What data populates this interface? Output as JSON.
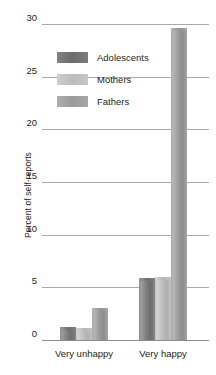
{
  "chart_data": {
    "type": "bar",
    "title": "",
    "subtitle": "",
    "xlabel": "",
    "ylabel": "Percent of self-reports",
    "categories": [
      "Very unhappy",
      "Very happy"
    ],
    "series": [
      {
        "name": "Adolescents",
        "color": "#6c6c6c",
        "values": [
          1.2,
          5.9
        ]
      },
      {
        "name": "Mothers",
        "color": "#bcbcbc",
        "values": [
          1.1,
          6.0
        ]
      },
      {
        "name": "Fathers",
        "color": "#9a9a9a",
        "values": [
          3.0,
          29.6
        ]
      }
    ],
    "ylim": [
      0,
      30
    ],
    "yticks": [
      0,
      5,
      10,
      15,
      20,
      25,
      30
    ],
    "ytick_labels": [
      "0",
      "5",
      "10",
      "15",
      "20",
      "25",
      "30"
    ],
    "grid": "horizontal",
    "legend_position": "upper-left-inside",
    "gridline_color": "#a9a9a9",
    "background": "#ffffff",
    "text_color": "#231f20"
  }
}
